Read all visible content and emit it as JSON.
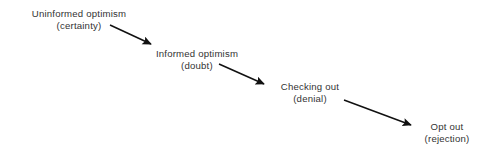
{
  "diagram": {
    "type": "flow-sequence",
    "background_color": "#ffffff",
    "text_color": "#333333",
    "arrow_color": "#111111",
    "width": 478,
    "height": 156,
    "stages": [
      {
        "id": "uninformed-optimism",
        "title": "Uninformed optimism",
        "subtitle": "(certainty)",
        "center_x": 79,
        "top_y": 8
      },
      {
        "id": "informed-optimism",
        "title": "Informed optimism",
        "subtitle": "(doubt)",
        "center_x": 197,
        "top_y": 48
      },
      {
        "id": "checking-out",
        "title": "Checking out",
        "subtitle": "(denial)",
        "center_x": 310,
        "top_y": 81
      },
      {
        "id": "opt-out",
        "title": "Opt out",
        "subtitle": "(rejection)",
        "center_x": 447,
        "top_y": 121
      }
    ],
    "arrows": [
      {
        "id": "arrow-1",
        "from": "uninformed-optimism",
        "to": "informed-optimism",
        "x1": 110,
        "y1": 25,
        "x2": 151,
        "y2": 44
      },
      {
        "id": "arrow-2",
        "from": "informed-optimism",
        "to": "checking-out",
        "x1": 219,
        "y1": 64,
        "x2": 264,
        "y2": 84
      },
      {
        "id": "arrow-3",
        "from": "checking-out",
        "to": "opt-out",
        "x1": 344,
        "y1": 100,
        "x2": 411,
        "y2": 125
      }
    ]
  }
}
